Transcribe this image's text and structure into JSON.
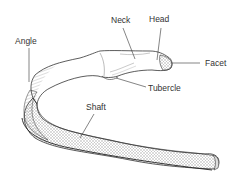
{
  "diagram": {
    "labels": {
      "neck": "Neck",
      "head": "Head",
      "angle": "Angle",
      "facet": "Facet",
      "tubercle": "Tubercle",
      "shaft": "Shaft"
    },
    "colors": {
      "outline": "#333333",
      "hatching": "#666666",
      "background": "#ffffff",
      "text": "#333333"
    }
  }
}
